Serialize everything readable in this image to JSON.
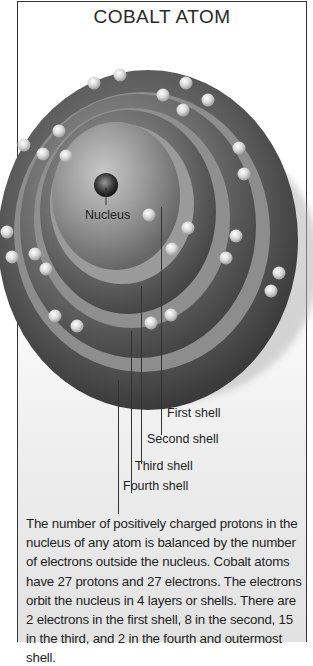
{
  "title": "COBALT ATOM",
  "labels": {
    "nucleus": "Nucleus",
    "first_shell": "First shell",
    "second_shell": "Second shell",
    "third_shell": "Third shell",
    "fourth_shell": "Fourth shell"
  },
  "description": "The number of positively charged protons in the nucleus of any atom is balanced by the number of electrons outside the nucleus. Cobalt atoms have 27 protons and 27 electrons. The electrons orbit the nucleus in 4 layers or shells. There are 2 electrons in the first shell, 8 in the second, 15 in the third, and 2 in the fourth and outermost shell.",
  "element": {
    "name": "Cobalt",
    "protons": 27,
    "electrons": 27,
    "shells": [
      {
        "name": "First shell",
        "electrons": 2
      },
      {
        "name": "Second shell",
        "electrons": 8
      },
      {
        "name": "Third shell",
        "electrons": 15
      },
      {
        "name": "Fourth shell",
        "electrons": 2
      }
    ]
  }
}
